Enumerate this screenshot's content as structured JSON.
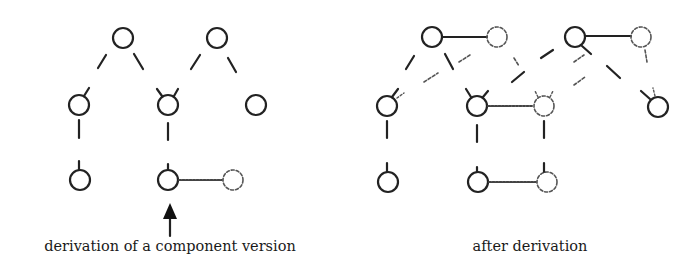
{
  "figure": {
    "left_panel": {
      "caption": "derivation of a component version"
    },
    "right_panel": {
      "caption": "after derivation"
    },
    "colors": {
      "stroke": "#222222",
      "background": "#ffffff"
    }
  }
}
